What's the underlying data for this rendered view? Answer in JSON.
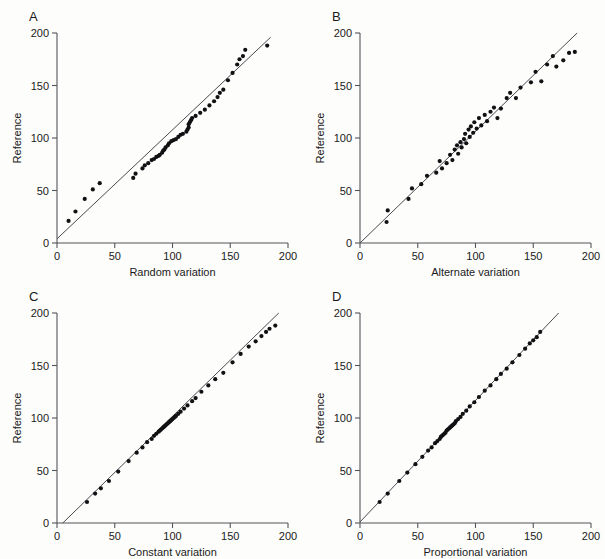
{
  "figure": {
    "name": "method-comparison-scatter-panels",
    "background": "#ffffff",
    "point_color": "#111114",
    "line_color": "#4a4a50",
    "axis_color": "#55545a"
  },
  "axes_common": {
    "ylabel": "Reference",
    "xticks": [
      0,
      50,
      100,
      150,
      200
    ],
    "yticks": [
      0,
      50,
      100,
      150,
      200
    ],
    "xtick_labels": [
      "0",
      "50",
      "100",
      "150",
      "200"
    ],
    "ytick_labels": [
      "0",
      "50",
      "100",
      "150",
      "200"
    ],
    "xlim": [
      0,
      200
    ],
    "ylim": [
      0,
      200
    ],
    "grid": false
  },
  "panels": [
    {
      "letter": "A",
      "xlabel": "Random variation"
    },
    {
      "letter": "B",
      "xlabel": "Alternate variation"
    },
    {
      "letter": "C",
      "xlabel": "Constant variation"
    },
    {
      "letter": "D",
      "xlabel": "Proportional variation"
    }
  ],
  "chart_data": [
    {
      "type": "scatter",
      "panel": "A",
      "title": "A",
      "xlabel": "Random variation",
      "ylabel": "Reference",
      "xlim": [
        0,
        200
      ],
      "ylim": [
        0,
        200
      ],
      "xticks": [
        0,
        50,
        100,
        150,
        200
      ],
      "yticks": [
        0,
        50,
        100,
        150,
        200
      ],
      "grid": false,
      "legend": null,
      "fit_line": {
        "x": [
          0,
          185
        ],
        "y": [
          4,
          196
        ],
        "slope": 1.038,
        "intercept": 4
      },
      "x": [
        10,
        16,
        24,
        31,
        37,
        66,
        68,
        74,
        76,
        79,
        82,
        84,
        86,
        88,
        89,
        91,
        92,
        93,
        94,
        96,
        97,
        99,
        101,
        103,
        105,
        107,
        109,
        112,
        113,
        114,
        114,
        115,
        116,
        117,
        120,
        124,
        128,
        132,
        136,
        139,
        141,
        144,
        148,
        152,
        156,
        158,
        161,
        163,
        182
      ],
      "y": [
        21,
        30,
        42,
        51,
        57,
        62,
        66,
        71,
        74,
        76,
        79,
        80,
        82,
        83,
        84,
        86,
        88,
        89,
        91,
        93,
        95,
        97,
        98,
        99,
        101,
        103,
        104,
        106,
        108,
        110,
        113,
        115,
        117,
        119,
        121,
        124,
        127,
        131,
        135,
        139,
        143,
        146,
        155,
        162,
        170,
        175,
        178,
        184,
        188
      ]
    },
    {
      "type": "scatter",
      "panel": "B",
      "title": "B",
      "xlabel": "Alternate variation",
      "ylabel": "Reference",
      "xlim": [
        0,
        200
      ],
      "ylim": [
        0,
        200
      ],
      "xticks": [
        0,
        50,
        100,
        150,
        200
      ],
      "yticks": [
        0,
        50,
        100,
        150,
        200
      ],
      "grid": false,
      "legend": null,
      "fit_line": {
        "x": [
          0,
          188
        ],
        "y": [
          0,
          200
        ],
        "slope": 1.064,
        "intercept": 0
      },
      "x": [
        23,
        24,
        42,
        45,
        53,
        58,
        66,
        69,
        71,
        75,
        78,
        80,
        82,
        84,
        85,
        87,
        88,
        90,
        91,
        92,
        94,
        95,
        96,
        98,
        99,
        101,
        103,
        105,
        108,
        110,
        113,
        116,
        119,
        122,
        127,
        130,
        135,
        139,
        148,
        152,
        157,
        162,
        167,
        170,
        176,
        181,
        186
      ],
      "y": [
        20,
        31,
        42,
        52,
        56,
        64,
        67,
        78,
        71,
        76,
        84,
        79,
        89,
        93,
        85,
        96,
        91,
        99,
        104,
        95,
        108,
        101,
        111,
        105,
        115,
        109,
        119,
        112,
        122,
        116,
        125,
        129,
        119,
        128,
        138,
        143,
        138,
        148,
        153,
        163,
        154,
        170,
        178,
        168,
        174,
        181,
        182
      ]
    },
    {
      "type": "scatter",
      "panel": "C",
      "title": "C",
      "xlabel": "Constant variation",
      "ylabel": "Reference",
      "xlim": [
        0,
        200
      ],
      "ylim": [
        0,
        200
      ],
      "xticks": [
        0,
        50,
        100,
        150,
        200
      ],
      "yticks": [
        0,
        50,
        100,
        150,
        200
      ],
      "grid": false,
      "legend": null,
      "fit_line": {
        "x": [
          5,
          192
        ],
        "y": [
          0,
          200
        ],
        "slope": 1.07,
        "intercept": -5.3
      },
      "x": [
        26,
        33,
        38,
        45,
        53,
        62,
        69,
        74,
        78,
        82,
        84,
        86,
        88,
        89,
        90,
        91,
        92,
        93,
        94,
        95,
        96,
        97,
        98,
        99,
        100,
        101,
        102,
        103,
        105,
        107,
        110,
        113,
        117,
        120,
        125,
        131,
        137,
        144,
        152,
        159,
        166,
        172,
        177,
        181,
        184,
        189
      ],
      "y": [
        20,
        28,
        33,
        40,
        49,
        59,
        67,
        72,
        77,
        80,
        83,
        85,
        87,
        88,
        89,
        90,
        91,
        92,
        93,
        94,
        95,
        96,
        97,
        98,
        99,
        100,
        101,
        102,
        104,
        106,
        109,
        112,
        116,
        119,
        125,
        131,
        137,
        143,
        153,
        161,
        168,
        173,
        178,
        182,
        185,
        188
      ]
    },
    {
      "type": "scatter",
      "panel": "D",
      "title": "D",
      "xlabel": "Proportional variation",
      "ylabel": "Reference",
      "xlim": [
        0,
        200
      ],
      "ylim": [
        0,
        200
      ],
      "xticks": [
        0,
        50,
        100,
        150,
        200
      ],
      "yticks": [
        0,
        50,
        100,
        150,
        200
      ],
      "grid": false,
      "legend": null,
      "fit_line": {
        "x": [
          0,
          172
        ],
        "y": [
          1,
          200
        ],
        "slope": 1.157,
        "intercept": 1
      },
      "x": [
        17,
        24,
        34,
        41,
        48,
        54,
        59,
        62,
        65,
        67,
        69,
        70,
        71,
        72,
        73,
        74,
        75,
        76,
        77,
        78,
        79,
        80,
        81,
        82,
        83,
        85,
        87,
        89,
        92,
        95,
        99,
        103,
        108,
        113,
        118,
        122,
        127,
        132,
        138,
        143,
        147,
        150,
        153,
        156
      ],
      "y": [
        20,
        28,
        40,
        48,
        56,
        63,
        69,
        72,
        76,
        78,
        80,
        82,
        83,
        84,
        85,
        86,
        88,
        89,
        90,
        91,
        92,
        93,
        94,
        95,
        97,
        99,
        101,
        104,
        107,
        111,
        115,
        120,
        126,
        131,
        137,
        142,
        147,
        153,
        160,
        166,
        171,
        174,
        177,
        182
      ]
    }
  ]
}
